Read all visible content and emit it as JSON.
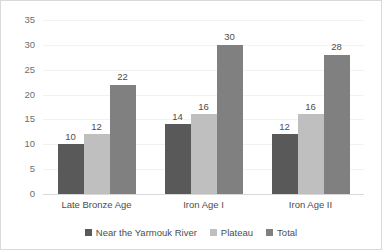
{
  "chart_data": {
    "type": "bar",
    "title": "",
    "subtitle": "",
    "xlabel": "",
    "ylabel": "",
    "categories": [
      "Late Bronze Age",
      "Iron Age I",
      "Iron Age II"
    ],
    "series": [
      {
        "name": "Near the Yarmouk River",
        "values": [
          10,
          14,
          12
        ],
        "color": "#595959"
      },
      {
        "name": "Plateau",
        "values": [
          12,
          16,
          16
        ],
        "color": "#bfbfbf"
      },
      {
        "name": "Total",
        "values": [
          22,
          30,
          28
        ],
        "color": "#808080"
      }
    ],
    "ylim": [
      0,
      35
    ],
    "ytick_step": 5,
    "yticks": [
      0,
      5,
      10,
      15,
      20,
      25,
      30,
      35
    ],
    "ytick_labels": [
      "0",
      "5",
      "10",
      "15",
      "20",
      "25",
      "30",
      "35"
    ],
    "grid": true,
    "grid_axis": "y",
    "legend_position": "bottom",
    "data_labels": true,
    "data_label_values": [
      [
        "10",
        "12",
        "22"
      ],
      [
        "14",
        "16",
        "30"
      ],
      [
        "12",
        "16",
        "28"
      ]
    ],
    "colors": {
      "gridline": "#f2f2f2",
      "axis": "#d9d9d9",
      "text": "#4d4d4d",
      "tick_text": "#6e6e6e",
      "background": "#ffffff",
      "border": "#d9d9d9"
    }
  }
}
